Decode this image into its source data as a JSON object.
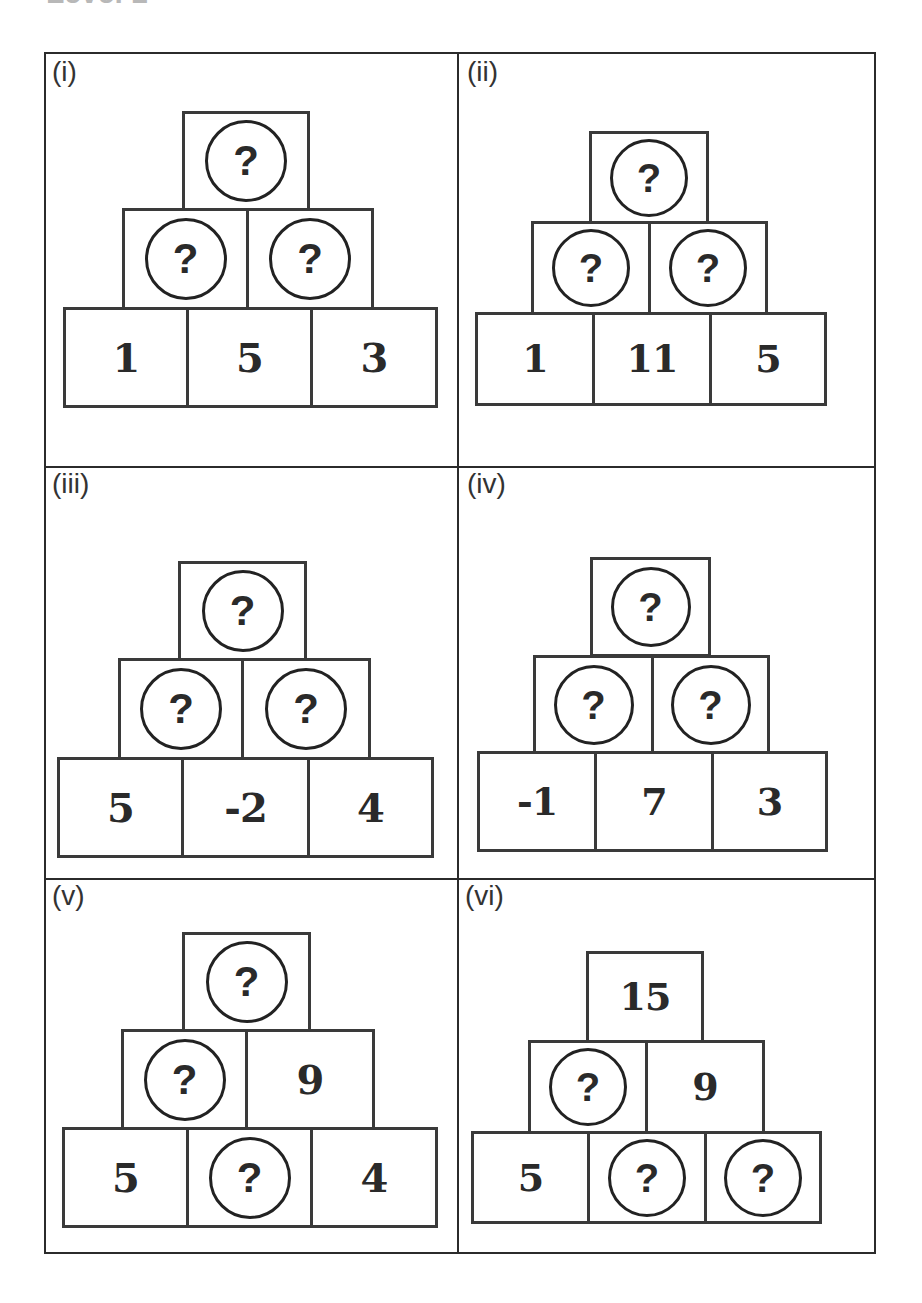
{
  "header": {
    "title_partial": "Level 1"
  },
  "unknown_symbol": "?",
  "panels": [
    {
      "label": "(i)",
      "top": "?",
      "middle": [
        "?",
        "?"
      ],
      "bottom": [
        "1",
        "5",
        "3"
      ]
    },
    {
      "label": "(ii)",
      "top": "?",
      "middle": [
        "?",
        "?"
      ],
      "bottom": [
        "1",
        "11",
        "5"
      ]
    },
    {
      "label": "(iii)",
      "top": "?",
      "middle": [
        "?",
        "?"
      ],
      "bottom": [
        "5",
        "-2",
        "4"
      ]
    },
    {
      "label": "(iv)",
      "top": "?",
      "middle": [
        "?",
        "?"
      ],
      "bottom": [
        "-1",
        "7",
        "3"
      ]
    },
    {
      "label": "(v)",
      "top": "?",
      "middle": [
        "?",
        "9"
      ],
      "bottom": [
        "5",
        "?",
        "4"
      ]
    },
    {
      "label": "(vi)",
      "top": "15",
      "middle": [
        "?",
        "9"
      ],
      "bottom": [
        "5",
        "?",
        "?"
      ]
    }
  ]
}
